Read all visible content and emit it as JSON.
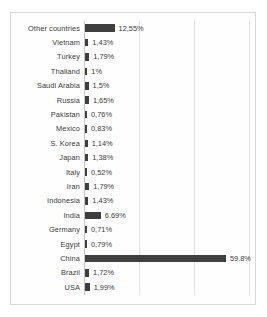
{
  "chart_data": {
    "type": "bar",
    "orientation": "horizontal",
    "title": "",
    "xlabel": "",
    "ylabel": "",
    "xlim": [
      0,
      70
    ],
    "grid": true,
    "gridlines_at": [
      0,
      20,
      40,
      60
    ],
    "legend": "none",
    "bar_color": "#3f3f3f",
    "categories": [
      "Other countries",
      "Vietnam",
      "Turkey",
      "Thailand",
      "Saudi Arabia",
      "Russia",
      "Pakistan",
      "Mexico",
      "S. Korea",
      "Japan",
      "Italy",
      "Iran",
      "Indonesia",
      "India",
      "Germany",
      "Egypt",
      "China",
      "Brazil",
      "USA"
    ],
    "values": [
      12.55,
      1.43,
      1.79,
      1.0,
      1.5,
      1.65,
      0.76,
      0.83,
      1.14,
      1.38,
      0.52,
      1.79,
      1.43,
      6.69,
      0.71,
      0.79,
      59.8,
      1.72,
      1.99
    ],
    "data_labels": [
      "12,55%",
      "1,43%",
      "1,79%",
      "1%",
      "1,5%",
      "1,65%",
      "0,76%",
      "0,83%",
      "1,14%",
      "1,38%",
      "0,52%",
      "1,79%",
      "1,43%",
      "6.69%",
      "0,71%",
      "0,79%",
      "59.8%",
      "1,72%",
      "1,99%"
    ]
  }
}
